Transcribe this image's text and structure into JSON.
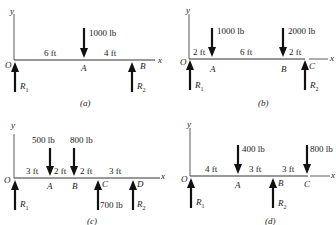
{
  "diagrams": {
    "a": {
      "caption": "(a)",
      "origin": "O",
      "x_axis": "x",
      "y_axis": "y",
      "points": [
        "A",
        "B"
      ],
      "spans": [
        "6 ft",
        "4 ft"
      ],
      "loads": [
        {
          "at": "A",
          "label": "1000 lb",
          "direction": "down"
        }
      ],
      "reactions": [
        {
          "at": "O",
          "label": "R1"
        },
        {
          "at": "B",
          "label": "R2"
        }
      ]
    },
    "b": {
      "caption": "(b)",
      "origin": "O",
      "x_axis": "x",
      "y_axis": "y",
      "points": [
        "A",
        "B",
        "C"
      ],
      "spans": [
        "2 ft",
        "6 ft",
        "2 ft"
      ],
      "loads": [
        {
          "at": "A",
          "label": "1000 lb",
          "direction": "down"
        },
        {
          "at": "B",
          "label": "2000 lb",
          "direction": "down"
        }
      ],
      "reactions": [
        {
          "at": "O",
          "label": "R1"
        },
        {
          "at": "C",
          "label": "R2"
        }
      ]
    },
    "c": {
      "caption": "(c)",
      "origin": "O",
      "x_axis": "x",
      "y_axis": "y",
      "points": [
        "A",
        "B",
        "C",
        "D"
      ],
      "spans": [
        "3 ft",
        "2 ft",
        "2 ft",
        "3 ft"
      ],
      "loads": [
        {
          "at": "A",
          "label": "500 lb",
          "direction": "down"
        },
        {
          "at": "B",
          "label": "800 lb",
          "direction": "down"
        },
        {
          "at": "C",
          "label": "700 lb",
          "direction": "up"
        }
      ],
      "reactions": [
        {
          "at": "O",
          "label": "R1"
        },
        {
          "at": "D",
          "label": "R2"
        }
      ]
    },
    "d": {
      "caption": "(d)",
      "origin": "O",
      "x_axis": "x",
      "y_axis": "y",
      "points": [
        "A",
        "B",
        "C"
      ],
      "spans": [
        "4 ft",
        "3 ft",
        "3 ft"
      ],
      "loads": [
        {
          "at": "A",
          "label": "400 lb",
          "direction": "down"
        },
        {
          "at": "C",
          "label": "800 lb",
          "direction": "down"
        }
      ],
      "reactions": [
        {
          "at": "O",
          "label": "R1"
        },
        {
          "at": "B",
          "label": "R2"
        }
      ]
    }
  },
  "labels": {
    "R1_sub": "1",
    "R2_sub": "2",
    "R": "R"
  }
}
